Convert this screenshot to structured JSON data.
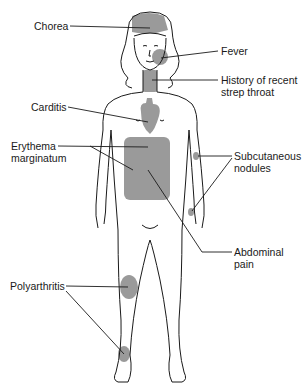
{
  "figure": {
    "background": "#ffffff",
    "line_color": "#1a1a1a",
    "highlight_color": "#999999"
  },
  "labels": {
    "chorea": "Chorea",
    "fever": "Fever",
    "strep_line1": "History of recent",
    "strep_line2": "strep throat",
    "carditis": "Carditis",
    "erythema_line1": "Erythema",
    "erythema_line2": "marginatum",
    "nodules_line1": "Subcutaneous",
    "nodules_line2": "nodules",
    "abdominal_line1": "Abdominal",
    "abdominal_line2": "pain",
    "polyarthritis": "Polyarthritis"
  }
}
